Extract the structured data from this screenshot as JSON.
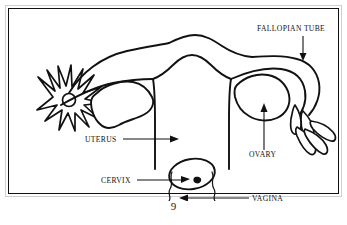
{
  "figure": {
    "page_number": "9",
    "frame_color": "#111111",
    "line_color": "#111111",
    "background_color": "#ffffff"
  },
  "labels": {
    "fallopian_tube": "FALLOPIAN TUBE",
    "uterus": "UTERUS",
    "ovary": "OVARY",
    "cervix": "CERVIX",
    "vagina": "VAGINA"
  },
  "annotations": [
    {
      "id": "fallopian-tube",
      "text": "FALLOPIAN TUBE",
      "text_x": 248,
      "text_y": 22,
      "anchor": "start",
      "arrow_direction": "down",
      "arrow": {
        "x1": 294,
        "y1": 27,
        "x2": 294,
        "y2": 50
      }
    },
    {
      "id": "uterus",
      "text": "UTERUS",
      "text_x": 76,
      "text_y": 133,
      "anchor": "start",
      "arrow_direction": "right",
      "arrow": {
        "x1": 114,
        "y1": 130,
        "x2": 168,
        "y2": 130
      }
    },
    {
      "id": "ovary",
      "text": "OVARY",
      "text_x": 240,
      "text_y": 147,
      "anchor": "start",
      "arrow_direction": "up",
      "arrow": {
        "x1": 255,
        "y1": 140,
        "x2": 255,
        "y2": 100
      }
    },
    {
      "id": "cervix",
      "text": "CERVIX",
      "text_x": 92,
      "text_y": 174,
      "anchor": "start",
      "arrow_direction": "right",
      "arrow": {
        "x1": 128,
        "y1": 171,
        "x2": 177,
        "y2": 171
      }
    },
    {
      "id": "vagina",
      "text": "VAGINA",
      "text_x": 243,
      "text_y": 192,
      "anchor": "start",
      "arrow_direction": "left",
      "arrow": {
        "x1": 240,
        "y1": 189,
        "x2": 172,
        "y2": 189
      }
    }
  ],
  "structures": [
    {
      "id": "left-fimbriae",
      "name": "left-fimbriae-star",
      "shape": "radiating-petals"
    },
    {
      "id": "left-fallopian-tube",
      "name": "left-fallopian-tube",
      "shape": "curved-tube"
    },
    {
      "id": "left-ovary",
      "name": "left-ovary",
      "shape": "irregular-blob"
    },
    {
      "id": "uterus-body",
      "name": "uterus-body",
      "shape": "dome"
    },
    {
      "id": "right-fallopian-tube",
      "name": "right-fallopian-tube",
      "shape": "curved-tube"
    },
    {
      "id": "right-ovary",
      "name": "right-ovary",
      "shape": "irregular-blob"
    },
    {
      "id": "right-fimbriae",
      "name": "right-fimbriae-fingers",
      "shape": "finger-projections"
    },
    {
      "id": "cervix",
      "name": "cervix-oval",
      "shape": "oval-with-os"
    },
    {
      "id": "vaginal-canal",
      "name": "vaginal-canal",
      "shape": "wavy-channel"
    }
  ]
}
